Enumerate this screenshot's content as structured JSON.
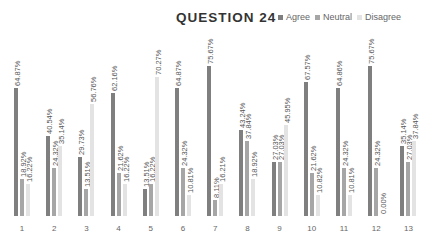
{
  "chart_data": {
    "type": "bar",
    "title": "QUESTION 24",
    "xlabel": "",
    "ylabel": "",
    "ylim": [
      0,
      80
    ],
    "grid": false,
    "legend_position": "top-right",
    "categories": [
      "1",
      "2",
      "3",
      "4",
      "5",
      "6",
      "7",
      "8",
      "9",
      "10",
      "11",
      "12",
      "13"
    ],
    "series": [
      {
        "name": "Agree",
        "color": "#7f7f7f",
        "values": [
          64.87,
          40.54,
          29.73,
          62.16,
          13.51,
          64.87,
          75.67,
          43.24,
          27.03,
          67.57,
          64.86,
          75.67,
          35.14
        ],
        "labels": [
          "64.87%",
          "40.54%",
          "29.73%",
          "62.16%",
          "13.51%",
          "64.87%",
          "75.67%",
          "43.24%",
          "27.03%",
          "67.57%",
          "64.86%",
          "75.67%",
          "35.14%"
        ]
      },
      {
        "name": "Neutral",
        "color": "#a6a6a6",
        "values": [
          18.92,
          24.32,
          13.51,
          21.62,
          16.22,
          24.32,
          8.11,
          37.84,
          27.03,
          21.62,
          24.32,
          24.32,
          27.03
        ],
        "labels": [
          "18.92%",
          "24.32%",
          "13.51%",
          "21.62%",
          "16.22%",
          "24.32%",
          "8.11%",
          "37.84%",
          "27.03%",
          "21.62%",
          "24.32%",
          "24.32%",
          "27.03%"
        ]
      },
      {
        "name": "Disagree",
        "color": "#e3e3e3",
        "values": [
          16.22,
          35.14,
          56.76,
          16.22,
          70.27,
          10.81,
          16.21,
          18.92,
          45.95,
          10.82,
          10.81,
          0.0,
          37.84
        ],
        "labels": [
          "16.22%",
          "35.14%",
          "56.76%",
          "16.22%",
          "70.27%",
          "10.81%",
          "16.21%",
          "18.92%",
          "45.95%",
          "10.82%",
          "10.81%",
          "0.00%",
          "37.84%"
        ]
      }
    ]
  },
  "legend": {
    "items": [
      {
        "label": "Agree",
        "color": "#7f7f7f"
      },
      {
        "label": "Neutral",
        "color": "#a6a6a6"
      },
      {
        "label": "Disagree",
        "color": "#e3e3e3"
      }
    ]
  }
}
